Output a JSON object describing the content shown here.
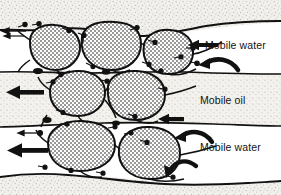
{
  "figure": {
    "name": "emulsion-droplets-in-porous-channel",
    "background_color": "#fbfbfa",
    "line_color": "#111111"
  },
  "labels": {
    "mobile_water_top": "Mobile water",
    "mobile_oil": "Mobile oil",
    "mobile_water_bottom": "Mobile water"
  },
  "regions": [
    {
      "id": "rock-top",
      "label": "",
      "texture": "stipple-grain",
      "color": "#e8e6e2"
    },
    {
      "id": "water-top",
      "label": "Mobile water",
      "texture": "plain",
      "color": "#ffffff"
    },
    {
      "id": "oil-middle",
      "label": "Mobile oil",
      "texture": "stipple-grain",
      "color": "#e6e4e0"
    },
    {
      "id": "water-bottom",
      "label": "Mobile water",
      "texture": "plain",
      "color": "#ffffff"
    },
    {
      "id": "rock-bottom",
      "label": "",
      "texture": "stipple-grain",
      "color": "#eceae6"
    }
  ],
  "droplets": [
    {
      "id": "droplet-1",
      "row": "top",
      "cx": 52,
      "cy": 48,
      "rx": 27,
      "ry": 24
    },
    {
      "id": "droplet-2",
      "row": "top",
      "cx": 110,
      "cy": 45,
      "rx": 30,
      "ry": 24
    },
    {
      "id": "droplet-3",
      "row": "top",
      "cx": 168,
      "cy": 52,
      "rx": 26,
      "ry": 22
    },
    {
      "id": "droplet-4",
      "row": "middle",
      "cx": 78,
      "cy": 93,
      "rx": 29,
      "ry": 23
    },
    {
      "id": "droplet-5",
      "row": "middle",
      "cx": 136,
      "cy": 95,
      "rx": 29,
      "ry": 25
    },
    {
      "id": "droplet-6",
      "row": "bottom",
      "cx": 82,
      "cy": 145,
      "rx": 33,
      "ry": 25
    },
    {
      "id": "droplet-7",
      "row": "bottom",
      "cx": 150,
      "cy": 152,
      "rx": 30,
      "ry": 26
    }
  ],
  "flow_arrows": [
    {
      "id": "arrow-water-top-left",
      "direction": "left",
      "weight": "thin",
      "x": 8,
      "y": 32
    },
    {
      "id": "arrow-oil-left-bold",
      "direction": "left",
      "weight": "bold",
      "x": 10,
      "y": 93
    },
    {
      "id": "arrow-water-bottom-thin",
      "direction": "left",
      "weight": "thin",
      "x": 16,
      "y": 124
    },
    {
      "id": "arrow-water-bottom-bold",
      "direction": "left",
      "weight": "bold",
      "x": 10,
      "y": 142
    },
    {
      "id": "arrow-water-top-right",
      "direction": "left",
      "weight": "bold",
      "x": 188,
      "y": 40
    },
    {
      "id": "arrow-water-top-curved",
      "direction": "left-curved",
      "weight": "bold",
      "x": 196,
      "y": 64
    },
    {
      "id": "arrow-oil-entry",
      "direction": "left",
      "weight": "bold",
      "x": 160,
      "y": 120
    },
    {
      "id": "arrow-bottom-curved-1",
      "direction": "left-curved",
      "weight": "bold",
      "x": 176,
      "y": 134
    },
    {
      "id": "arrow-bottom-curved-2",
      "direction": "left-curved",
      "weight": "bold",
      "x": 168,
      "y": 168
    }
  ],
  "surfactant_markers": {
    "id": "surfactant-molecules",
    "description": "dots with tails at interfaces",
    "count": 26
  }
}
